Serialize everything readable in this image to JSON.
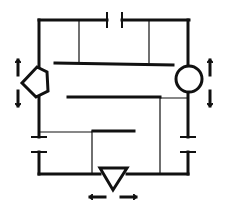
{
  "diagram": {
    "colors": {
      "stroke": "#111111",
      "background": "#ffffff"
    },
    "components": [
      {
        "name": "top-gap-plates",
        "kind": "capacitor"
      },
      {
        "name": "left-gap-plates",
        "kind": "capacitor"
      },
      {
        "name": "right-gap-plates",
        "kind": "capacitor"
      },
      {
        "name": "pentagon-node",
        "kind": "pentagon",
        "motion": "vertical"
      },
      {
        "name": "circle-node",
        "kind": "circle",
        "motion": "vertical"
      },
      {
        "name": "triangle-node",
        "kind": "triangle",
        "motion": "horizontal"
      },
      {
        "name": "upper-bar",
        "kind": "bar"
      },
      {
        "name": "middle-bar",
        "kind": "bar"
      },
      {
        "name": "lower-bar",
        "kind": "bar"
      }
    ]
  }
}
